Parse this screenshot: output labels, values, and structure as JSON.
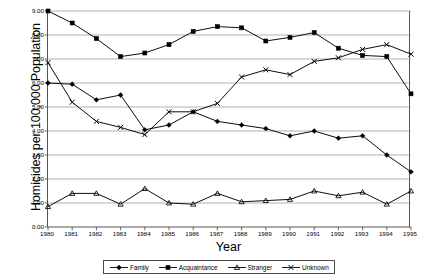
{
  "chart_data": {
    "type": "line",
    "title": "",
    "xlabel": "Year",
    "ylabel": "Homicides per 100,000 Population",
    "categories": [
      1980,
      1981,
      1982,
      1983,
      1984,
      1985,
      1986,
      1987,
      1988,
      1989,
      1990,
      1991,
      1992,
      1993,
      1994,
      1995
    ],
    "x_tick_labels": [
      "1980",
      "1981",
      "1982",
      "1983",
      "1984",
      "1985",
      "1986",
      "1987",
      "1988",
      "1989",
      "1990",
      "1991",
      "1992",
      "1993",
      "1994",
      "1995"
    ],
    "y_tick_labels": [
      "0.00",
      "1.00",
      "2.00",
      "3.00",
      "4.00",
      "5.00",
      "6.00",
      "7.00",
      "8.00",
      "9.00"
    ],
    "y_tick_values": [
      0,
      1,
      2,
      3,
      4,
      5,
      6,
      7,
      8,
      9
    ],
    "ylim": [
      0,
      9
    ],
    "xlim": [
      1980,
      1995
    ],
    "grid": "horizontal",
    "legend_position": "bottom",
    "series": [
      {
        "name": "Family",
        "marker": "diamond",
        "color": "#000000",
        "values": [
          6.0,
          5.95,
          5.3,
          5.5,
          4.05,
          4.25,
          4.8,
          4.4,
          4.25,
          4.1,
          3.8,
          4.0,
          3.7,
          3.8,
          3.0,
          2.3
        ]
      },
      {
        "name": "Acquaintance",
        "marker": "square",
        "color": "#000000",
        "values": [
          9.0,
          8.5,
          7.85,
          7.1,
          7.25,
          7.6,
          8.15,
          8.35,
          8.3,
          7.75,
          7.9,
          8.1,
          7.45,
          7.15,
          7.1,
          5.55
        ]
      },
      {
        "name": "Stranger",
        "marker": "triangle",
        "color": "#000000",
        "values": [
          0.85,
          1.4,
          1.4,
          0.95,
          1.6,
          1.0,
          0.95,
          1.4,
          1.05,
          1.1,
          1.15,
          1.5,
          1.3,
          1.45,
          0.95,
          1.5
        ]
      },
      {
        "name": "Unknown",
        "marker": "x",
        "color": "#000000",
        "values": [
          6.85,
          5.2,
          4.4,
          4.15,
          3.85,
          4.8,
          4.8,
          5.15,
          6.25,
          6.55,
          6.35,
          6.9,
          7.05,
          7.4,
          7.6,
          7.2
        ]
      }
    ]
  },
  "legend": {
    "items": [
      {
        "label": "Family",
        "marker": "diamond"
      },
      {
        "label": "Acquaintance",
        "marker": "square"
      },
      {
        "label": "Stranger",
        "marker": "triangle"
      },
      {
        "label": "Unknown",
        "marker": "x"
      }
    ]
  },
  "axes": {
    "y_title": "Homicides per 100,000 Population",
    "x_title": "Year"
  },
  "colors": {
    "line": "#000000",
    "grid": "#a8a8a8",
    "axis": "#555555",
    "background": "#ffffff"
  }
}
